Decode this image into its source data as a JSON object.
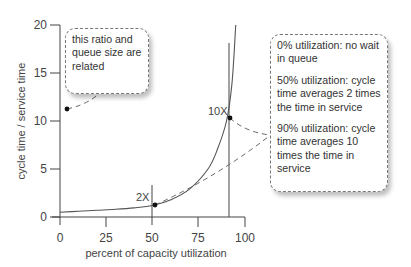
{
  "chart_data": {
    "type": "line",
    "title": "",
    "xlabel": "percent of capacity utilization",
    "ylabel": "cycle time / service time",
    "xlim": [
      0,
      100
    ],
    "ylim": [
      0,
      20
    ],
    "x_ticks": [
      "0",
      "25",
      "50",
      "75",
      "100"
    ],
    "y_ticks": [
      "0",
      "5",
      "10",
      "15",
      "20"
    ],
    "grid": false,
    "legend": null,
    "series": [
      {
        "name": "cycle time / service time",
        "x": [
          0,
          10,
          20,
          30,
          40,
          50,
          60,
          70,
          80,
          85,
          90,
          93,
          95
        ],
        "values": [
          0.5,
          0.6,
          0.7,
          0.8,
          0.95,
          1.2,
          1.8,
          2.9,
          5.0,
          7.0,
          10.0,
          14.0,
          20.0
        ]
      }
    ],
    "reference_lines": [
      {
        "x": 50,
        "label": "2X",
        "y_point": 1.2
      },
      {
        "x": 90,
        "label": "10X",
        "y_point": 10.3
      }
    ],
    "annotations": [
      {
        "id": "ratio_note",
        "text": "this ratio and queue size are related",
        "points_to": {
          "x": 5,
          "y": 11.2
        }
      },
      {
        "id": "utilization_notes",
        "points_to": [
          "2X",
          "10X"
        ],
        "paragraphs": [
          "0% utilization: no wait in queue",
          "50% utilization: cycle time averages 2 times the time in service",
          "90% utilization: cycle time averages 10 times the time in service"
        ]
      }
    ]
  },
  "axes": {
    "xlabel": "percent of capacity utilization",
    "ylabel": "cycle time / service time",
    "x_ticks": [
      "0",
      "25",
      "50",
      "75",
      "100"
    ],
    "y_ticks": [
      "0",
      "5",
      "10",
      "15",
      "20"
    ]
  },
  "markers": {
    "two_x": "2X",
    "ten_x": "10X"
  },
  "callouts": {
    "left": {
      "lines": [
        "this ratio and",
        "queue size are",
        "related"
      ]
    },
    "right": {
      "paragraphs": [
        [
          "0% utilization: no wait",
          "in queue"
        ],
        [
          "50% utilization: cycle",
          "time averages 2 times",
          "the time in service"
        ],
        [
          "90% utilization: cycle",
          "time averages 10",
          "times the time in",
          "service"
        ]
      ]
    }
  },
  "colors": {
    "axis": "#444444",
    "curve": "#555555",
    "dash": "#666666",
    "dot": "#111111"
  }
}
